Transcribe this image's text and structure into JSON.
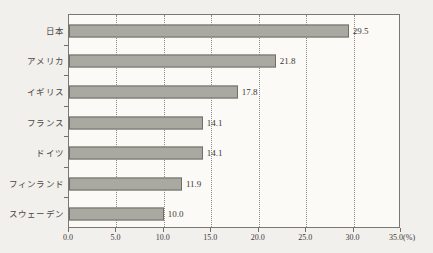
{
  "chart_data": {
    "type": "bar",
    "orientation": "horizontal",
    "title": "",
    "xlabel": "(%)",
    "ylabel": "",
    "xlim": [
      0.0,
      35.0
    ],
    "xticks": [
      "0.0",
      "5.0",
      "10.0",
      "15.0",
      "20.0",
      "25.0",
      "30.0",
      "35.0"
    ],
    "xtick_values": [
      0.0,
      5.0,
      10.0,
      15.0,
      20.0,
      25.0,
      30.0,
      35.0
    ],
    "unit_suffix": "(%)",
    "grid": "vertical-dotted",
    "legend": "none",
    "categories": [
      "日本",
      "アメリカ",
      "イギリス",
      "フランス",
      "ドイツ",
      "フィンランド",
      "スウェーデン"
    ],
    "values": [
      29.5,
      21.8,
      17.8,
      14.1,
      14.1,
      11.9,
      10.0
    ],
    "value_labels": [
      "29.5",
      "21.8",
      "17.8",
      "14.1",
      "14.1",
      "11.9",
      "10.0"
    ],
    "colors": {
      "bar_fill": "#a9a9a1",
      "bar_border": "#6f6e68",
      "plot_background": "#fbfaf7",
      "page_background": "#f2f0ec",
      "axis": "#6f6e68",
      "gridline": "#8d8b85",
      "text": "#3b3935"
    }
  }
}
